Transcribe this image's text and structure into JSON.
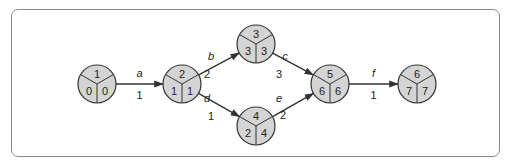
{
  "diagram": {
    "type": "activity-on-arrow network",
    "colors": {
      "node_fill": "#d4d4d4",
      "stroke": "#333333",
      "frame": "#8a8a8a"
    },
    "nodes": [
      {
        "id": "1",
        "es": "0",
        "lf": "0"
      },
      {
        "id": "2",
        "es": "1",
        "lf": "1"
      },
      {
        "id": "3",
        "es": "3",
        "lf": "3"
      },
      {
        "id": "4",
        "es": "2",
        "lf": "4"
      },
      {
        "id": "5",
        "es": "6",
        "lf": "6"
      },
      {
        "id": "6",
        "es": "7",
        "lf": "7"
      }
    ],
    "edges": [
      {
        "from": "1",
        "to": "2",
        "activity": "a",
        "duration": "1"
      },
      {
        "from": "2",
        "to": "3",
        "activity": "b",
        "duration": "2"
      },
      {
        "from": "2",
        "to": "4",
        "activity": "d",
        "duration": "1"
      },
      {
        "from": "3",
        "to": "5",
        "activity": "c",
        "duration": "3"
      },
      {
        "from": "4",
        "to": "5",
        "activity": "e",
        "duration": "2"
      },
      {
        "from": "5",
        "to": "6",
        "activity": "f",
        "duration": "1"
      }
    ]
  }
}
